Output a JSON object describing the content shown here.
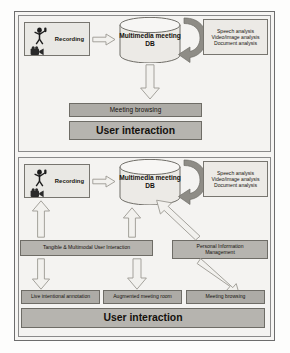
{
  "figure": {
    "panels": [
      {
        "id": "top",
        "name": "Passive multimedia meeting capture and browsing",
        "nodes": {
          "recording": {
            "label": "Recording",
            "icons": [
              "microphone-icon",
              "video-camera-icon"
            ]
          },
          "database": {
            "line1": "Multimedia",
            "line2": "meeting DB"
          },
          "analysis": {
            "lines": [
              "Speech analysis",
              "Video/image analysis",
              "Document analysis"
            ]
          },
          "meeting_browsing": {
            "label": "Meeting  browsing"
          },
          "user_interaction": {
            "label": "User interaction"
          }
        },
        "arrows": [
          {
            "name": "recording-to-db",
            "direction": "right",
            "style": "block-outline"
          },
          {
            "name": "db-to-analysis-loop",
            "direction": "curved-loop",
            "style": "solid-dark"
          },
          {
            "name": "db-to-meeting-browsing",
            "direction": "down",
            "style": "block-outline"
          }
        ]
      },
      {
        "id": "bottom",
        "name": "Interactive multimodal meeting system",
        "nodes": {
          "recording": {
            "label": "Recording",
            "icons": [
              "microphone-icon",
              "video-camera-icon"
            ]
          },
          "database": {
            "line1": "Multimedia",
            "line2": "meeting DB"
          },
          "analysis": {
            "lines": [
              "Speech analysis",
              "Video/image analysis",
              "Document analysis"
            ]
          },
          "tangible": {
            "label": "Tangible & Multimodal User Interaction"
          },
          "personal_information": {
            "line1": "Personal Information",
            "line2": "Management"
          },
          "live_annotation": {
            "label": "Live intentional annotation"
          },
          "augmented_room": {
            "label": "Augmented meeting room"
          },
          "meeting_browsing": {
            "label": "Meeting browsing"
          },
          "user_interaction": {
            "label": "User interaction"
          }
        },
        "arrows": [
          {
            "name": "recording-to-db",
            "direction": "right",
            "style": "block-outline"
          },
          {
            "name": "db-to-analysis-loop",
            "direction": "curved-loop",
            "style": "solid-dark"
          },
          {
            "name": "tangible-to-recording",
            "direction": "up",
            "style": "block-outline"
          },
          {
            "name": "tangible-to-db",
            "direction": "up",
            "style": "block-outline"
          },
          {
            "name": "personal-information-to-db",
            "direction": "up-left-diagonal",
            "style": "block-outline"
          },
          {
            "name": "tangible-to-live-annotation",
            "direction": "down",
            "style": "block-outline"
          },
          {
            "name": "db-to-augmented-room",
            "direction": "down",
            "style": "block-outline"
          },
          {
            "name": "personal-information-to-meeting-browsing",
            "direction": "down-right-diagonal",
            "style": "block-outline"
          }
        ]
      }
    ],
    "colors": {
      "frame_border": "#6d6d6d",
      "panel_background": "#f4f3f1",
      "box_fill": "#e9e8e4",
      "box_border": "#77756f",
      "bar_fill": "#adaba6",
      "bar_border": "#6e6c66",
      "arrow_outline_fill": "#f2f1ee",
      "arrow_outline_stroke": "#9b9992",
      "curved_arrow_fill": "#8e8c86",
      "text": "#17140f"
    }
  }
}
